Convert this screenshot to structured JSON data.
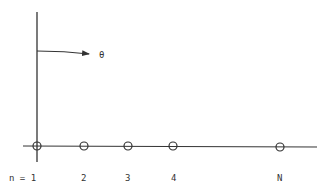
{
  "diagram": {
    "type": "chain-of-nodes",
    "angle_label": "θ",
    "node_labels": [
      "n = 1",
      "2",
      "3",
      "4",
      "N"
    ],
    "node_x": [
      37,
      84,
      128,
      173,
      280
    ],
    "colors": {
      "stroke": "#333333",
      "background": "#ffffff"
    }
  }
}
